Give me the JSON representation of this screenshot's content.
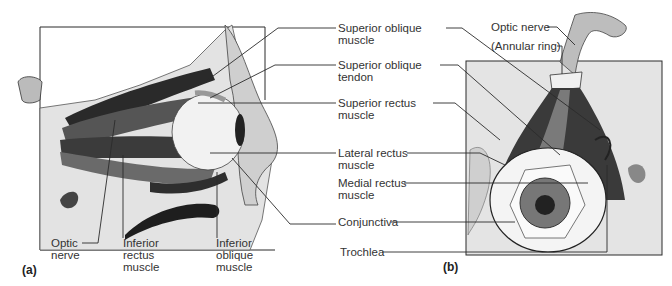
{
  "figure": {
    "panels": [
      {
        "id": "a",
        "tag": "(a)",
        "view": "lateral view of right eye in orbit"
      },
      {
        "id": "b",
        "tag": "(b)",
        "view": "superior (anterior) view of eye with muscles converging on annular ring"
      }
    ]
  },
  "labels": {
    "superior_oblique_muscle": "Superior oblique\nmuscle",
    "superior_oblique_tendon": "Superior oblique\ntendon",
    "superior_rectus_muscle": "Superior rectus\nmuscle",
    "lateral_rectus_muscle": "Lateral rectus\nmuscle",
    "medial_rectus_muscle": "Medial rectus\nmuscle",
    "conjunctiva": "Conjunctiva",
    "trochlea": "Trochlea",
    "optic_nerve_a": "Optic\nnerve",
    "inferior_rectus_muscle": "Inferior\nrectus\nmuscle",
    "inferior_oblique_muscle": "Inferior\noblique\nmuscle",
    "optic_nerve_b": "Optic nerve",
    "annular_ring": "(Annular ring)"
  },
  "colors": {
    "line": "#2b2b2b",
    "muscle_dark": "#3a3a3a",
    "muscle_mid": "#7a7a7a",
    "bone": "#d9d9d9",
    "panel_b_bg": "#e4e4e4",
    "eye_white": "#f4f4f4"
  }
}
